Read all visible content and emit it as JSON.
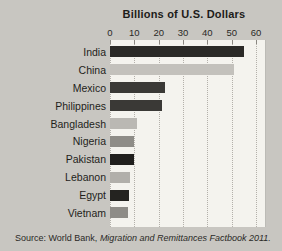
{
  "figure": {
    "background": "#c8c6c1",
    "plot_background": "#f4f3ee",
    "gridline_color": "#b3b0aa",
    "text_color": "#1f1e1b"
  },
  "title": "Billions of U.S. Dollars",
  "source": {
    "prefix": "Source: World Bank, ",
    "italic": "Migration and Remittances Factbook 2011."
  },
  "chart_data": {
    "type": "bar",
    "orientation": "horizontal",
    "title": "Billions of U.S. Dollars",
    "categories": [
      "India",
      "China",
      "Mexico",
      "Philippines",
      "Bangladesh",
      "Nigeria",
      "Pakistan",
      "Lebanon",
      "Egypt",
      "Vietnam"
    ],
    "values": [
      55,
      51,
      22.6,
      21.3,
      11.1,
      10.0,
      9.7,
      8.2,
      7.7,
      7.2
    ],
    "bar_colors": [
      "#2b2a27",
      "#c3c1bc",
      "#3a3936",
      "#3a3936",
      "#bab8b3",
      "#8e8c87",
      "#201f1d",
      "#b1afaa",
      "#242320",
      "#8e8c87"
    ],
    "xlim": [
      0,
      60
    ],
    "x_ticks": [
      0,
      10,
      20,
      30,
      40,
      50,
      60
    ],
    "xlabel": "Billions of U.S. Dollars",
    "ylabel": "",
    "grid": "vertical-dotted",
    "legend": "none",
    "source": "Source: World Bank, Migration and Remittances Factbook 2011."
  }
}
